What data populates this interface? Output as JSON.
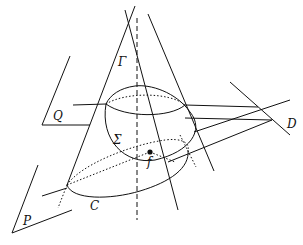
{
  "diagram": {
    "labels": {
      "gamma": "Γ",
      "sigma": "Σ",
      "q": "Q",
      "d": "D",
      "f": "f",
      "p": "P",
      "c": "C"
    },
    "colors": {
      "stroke": "#111111",
      "background": "#ffffff"
    }
  }
}
